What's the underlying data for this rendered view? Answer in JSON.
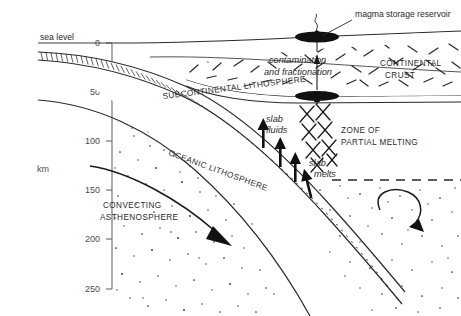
{
  "figure": {
    "axis": {
      "unit_label": "km",
      "ticks": [
        "0",
        "50",
        "100",
        "150",
        "200",
        "250"
      ],
      "tick_depths_km": [
        0,
        50,
        100,
        150,
        200,
        250
      ]
    },
    "labels": {
      "sea_level": "sea level",
      "magma_reservoir": "magma storage reservoir",
      "contamination_line1": "contamination",
      "contamination_line2": "and fractionation",
      "continental_crust_line1": "CONTINENTAL",
      "continental_crust_line2": "CRUST",
      "subcontinental_lithosphere": "SUBCONTINENTAL LITHOSPHERE",
      "oceanic_lithosphere": "OCEANIC LITHOSPHERE",
      "slab_fluids_line1": "slab",
      "slab_fluids_line2": "fluids",
      "slab_melts_line1": "slab",
      "slab_melts_line2": "melts",
      "zone_melting_line1": "ZONE OF",
      "zone_melting_line2": "PARTIAL MELTING",
      "convecting_line1": "CONVECTING",
      "convecting_line2": "ASTHENOSPHERE"
    },
    "colors": {
      "ink": "#1a1a1a",
      "axis": "#6b6b6b",
      "fill": "#ffffff",
      "magma": "#111111"
    }
  }
}
